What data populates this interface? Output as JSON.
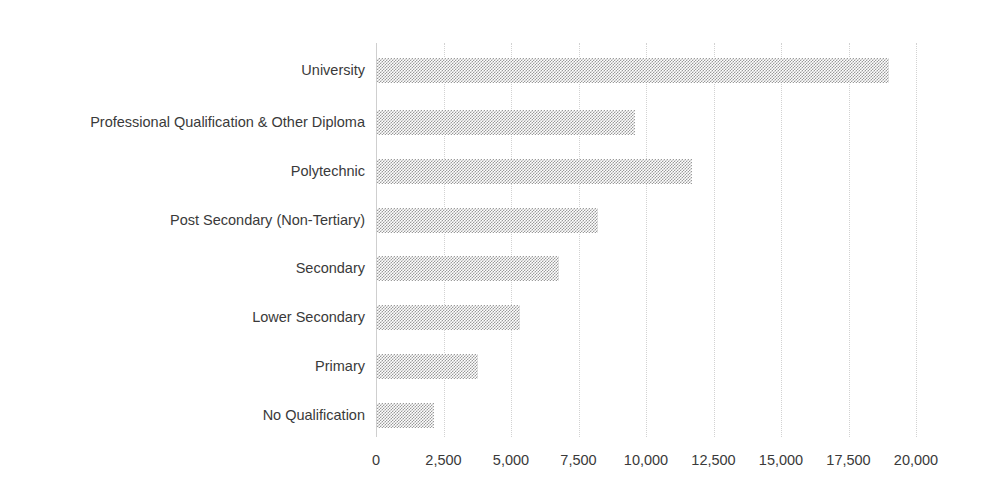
{
  "chart_data": {
    "type": "bar",
    "orientation": "horizontal",
    "title": "",
    "subtitle": "",
    "xlabel": "",
    "ylabel": "",
    "xlim": [
      0,
      20000
    ],
    "xtick_step": 2500,
    "grid": true,
    "legend": false,
    "bar_color": "#9a9a9a",
    "bar_pattern": "checkerboard-hatch",
    "categories": [
      "University",
      "Professional Qualification & Other Diploma",
      "Polytechnic",
      "Post Secondary (Non-Tertiary)",
      "Secondary",
      "Lower Secondary",
      "Primary",
      "No Qualification"
    ],
    "values": [
      18300,
      9200,
      11250,
      7900,
      6500,
      5100,
      3600,
      2050
    ],
    "xticks": [
      0,
      2500,
      5000,
      7500,
      10000,
      12500,
      15000,
      17500,
      20000
    ],
    "xtick_labels": [
      "0",
      "2,500",
      "5,000",
      "7,500",
      "10,000",
      "12,500",
      "15,000",
      "17,500",
      "20,000"
    ]
  }
}
